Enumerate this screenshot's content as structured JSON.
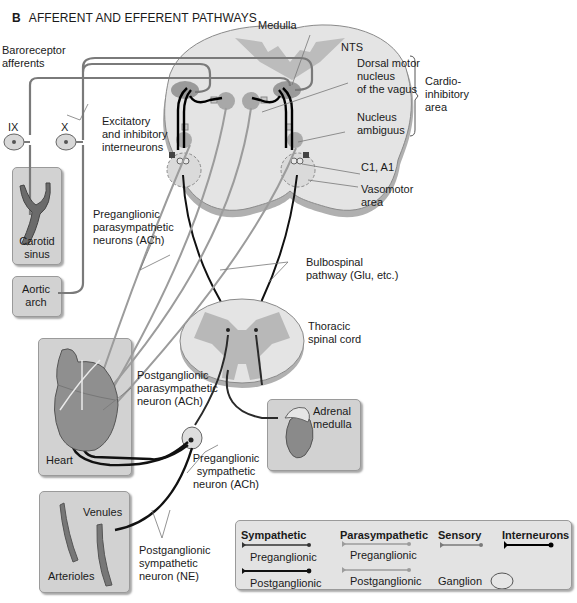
{
  "figure": {
    "panel_letter": "B",
    "title": "AFFERENT AND EFFERENT PATHWAYS"
  },
  "labels": {
    "medulla": "Medulla",
    "baroreceptor_afferents": [
      "Baroreceptor",
      "afferents"
    ],
    "nerve_ix": "IX",
    "nerve_x": "X",
    "excitatory_inhibitory": [
      "Excitatory",
      "and inhibitory",
      "interneurons"
    ],
    "nts": "NTS",
    "dorsal_motor_nucleus": [
      "Dorsal motor",
      "nucleus",
      "of the vagus"
    ],
    "cardioinhibitory_area": [
      "Cardio-",
      "inhibitory",
      "area"
    ],
    "nucleus_ambiguus": [
      "Nucleus",
      "ambiguus"
    ],
    "c1_a1": "C1, A1",
    "vasomotor_area": [
      "Vasomotor",
      "area"
    ],
    "carotid_sinus": [
      "Carotid",
      "sinus"
    ],
    "aortic_arch": [
      "Aortic",
      "arch"
    ],
    "preganglionic_parasympathetic": [
      "Preganglionic",
      "parasympathetic",
      "neurons (ACh)"
    ],
    "bulbospinal_pathway": [
      "Bulbospinal",
      "pathway (Glu, etc.)"
    ],
    "thoracic_spinal_cord": [
      "Thoracic",
      "spinal cord"
    ],
    "postganglionic_parasympathetic": [
      "Postganglionic",
      "parasympathetic",
      "neuron (ACh)"
    ],
    "adrenal_medulla": [
      "Adrenal",
      "medulla"
    ],
    "heart": "Heart",
    "preganglionic_sympathetic": [
      "Preganglionic",
      "sympathetic",
      "neuron (ACh)"
    ],
    "venules": "Venules",
    "arterioles": "Arterioles",
    "postganglionic_sympathetic": [
      "Postganglionic",
      "sympathetic",
      "neuron (NE)"
    ]
  },
  "legend": {
    "sympathetic": {
      "heading": "Sympathetic",
      "pre": "Preganglionic",
      "post": "Postganglionic",
      "color": "#3a3a3a"
    },
    "parasympathetic": {
      "heading": "Parasympathetic",
      "pre": "Preganglionic",
      "post": "Postganglionic",
      "color": "#8c8c8c"
    },
    "sensory": {
      "heading": "Sensory",
      "color": "#707070"
    },
    "interneurons": {
      "heading": "Interneurons",
      "color": "#000000"
    },
    "ganglion": "Ganglion"
  },
  "colors": {
    "medulla_fill": "#e6e6e6",
    "gray_matter": "#b8b8b8",
    "nucleus_fill": "#9a9a9a",
    "panel_fill": "#d2d2d2",
    "sensory_line": "#7a7a7a",
    "para_line": "#9c9c9c",
    "symp_line": "#2a2a2a"
  }
}
